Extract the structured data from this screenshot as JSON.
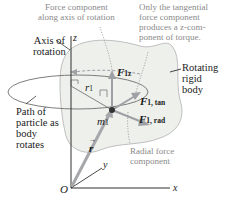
{
  "figure": {
    "colors": {
      "body_fill": "#eef0ec",
      "body_outline": "#9a9a9a",
      "axis": "#1a1a1a",
      "force_arrow": "#9da0a4",
      "position_vector": "#a5a7aa",
      "path_ellipse": "#6e6e6e",
      "annotation_text": "#8a8a8a",
      "label_text": "#1a1a1a",
      "particle": "#333333"
    },
    "callouts": {
      "axial_component": [
        "Force component",
        "along axis of rotation"
      ],
      "tangential_only": [
        "Only the tangential",
        "force component",
        "produces a z-com-",
        "ponent of torque."
      ],
      "radial_component": [
        "Radial force",
        "component"
      ]
    },
    "labels": {
      "axis_of_rotation": [
        "Axis of",
        "rotation"
      ],
      "rotating_body": [
        "Rotating",
        "rigid",
        "body"
      ],
      "path": [
        "Path of",
        "particle as",
        "body",
        "rotates"
      ]
    },
    "symbols": {
      "z_axis": "z",
      "y_axis": "y",
      "x_axis": "x",
      "origin": "O",
      "radius": "r",
      "radius_sub": "1",
      "mass": "m",
      "mass_sub": "1",
      "position_vector": "r",
      "F": "F",
      "F_z_sub": "1z",
      "F_tan_sub": "1, tan",
      "F_rad_sub": "1, rad"
    }
  }
}
